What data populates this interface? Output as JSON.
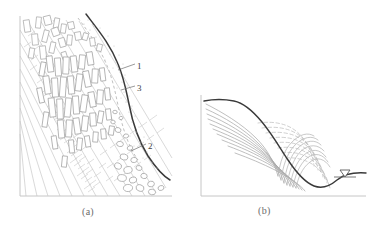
{
  "figure": {
    "type": "geotechnical-slope-cross-section",
    "panels": [
      {
        "id": "a",
        "caption": "(a)",
        "description": "slope cross-section showing bedrock, fractured zone and talus",
        "axis": {
          "origin_x": 20,
          "origin_y": 196,
          "top_y": 16,
          "right_x": 172
        },
        "labels": [
          {
            "key": "1",
            "text": "1",
            "x": 137,
            "y": 61,
            "meaning": "slip-surface-boundary"
          },
          {
            "key": "3",
            "text": "3",
            "x": 137,
            "y": 83,
            "meaning": "fractured-dilated-zone"
          },
          {
            "key": "2",
            "text": "2",
            "x": 148,
            "y": 141,
            "meaning": "talus-colluvium-blocks"
          }
        ],
        "leaders": [
          {
            "from_x": 135,
            "from_y": 64,
            "to_x": 118,
            "to_y": 70
          },
          {
            "from_x": 135,
            "from_y": 86,
            "to_x": 120,
            "to_y": 90
          },
          {
            "from_x": 146,
            "from_y": 144,
            "to_x": 131,
            "to_y": 150
          }
        ]
      },
      {
        "id": "b",
        "caption": "(b)",
        "description": "slope profile with deformation contour lines and groundwater level",
        "axis": {
          "origin_x": 201,
          "origin_y": 196,
          "top_y": 95,
          "right_x": 366
        },
        "water_symbol": {
          "x": 344,
          "y": 172,
          "glyph": "water-table-triangle"
        }
      }
    ],
    "colors": {
      "axis": "#bdbdbd",
      "dark_curve": "#3a3a3a",
      "contour": "#a8a8a8",
      "contour_dashed": "#b8b8b8",
      "block_outline": "#a0a0a0",
      "bedrock_line": "#c2c2c2",
      "stipple": "#c8c8c8",
      "label_text": "#3d3d3d",
      "caption_text": "#6b6b6b",
      "background": "#ffffff"
    }
  }
}
